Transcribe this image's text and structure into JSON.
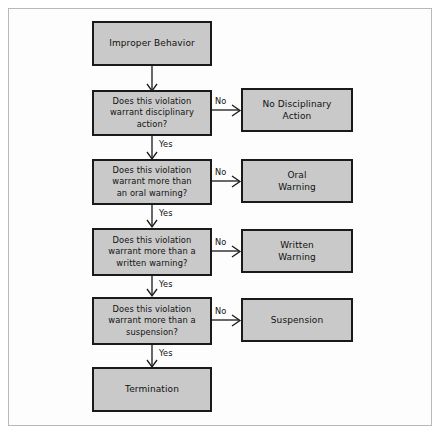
{
  "diagram": {
    "colors": {
      "node_fill": "#c9c9c9",
      "node_border": "#1a1a1a",
      "frame_border": "#b9b9b9",
      "background": "#ffffff",
      "text": "#111111"
    },
    "nodes": [
      {
        "id": "start",
        "label": "Improper Behavior"
      },
      {
        "id": "decision1",
        "label": "Does this violation\nwarrant disciplinary\naction?"
      },
      {
        "id": "outcome1",
        "label": "No Disciplinary\nAction"
      },
      {
        "id": "decision2",
        "label": "Does this violation\nwarrant more than\nan oral warning?"
      },
      {
        "id": "outcome2",
        "label": "Oral\nWarning"
      },
      {
        "id": "decision3",
        "label": "Does this violation\nwarrant more than a\nwritten warning?"
      },
      {
        "id": "outcome3",
        "label": "Written\nWarning"
      },
      {
        "id": "decision4",
        "label": "Does this violation\nwarrant more than a\nsuspension?"
      },
      {
        "id": "outcome4",
        "label": "Suspension"
      },
      {
        "id": "terminal",
        "label": "Termination"
      }
    ],
    "edge_labels": {
      "no1": "No",
      "yes1": "Yes",
      "no2": "No",
      "yes2": "Yes",
      "no3": "No",
      "yes3": "Yes",
      "no4": "No",
      "yes4": "Yes"
    }
  }
}
